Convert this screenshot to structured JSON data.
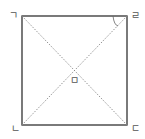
{
  "diagram": {
    "type": "square-with-diagonals",
    "vertices": {
      "top_left": {
        "label": "ㄱ",
        "x": 22,
        "y": 16
      },
      "top_right": {
        "label": "ㄹ",
        "x": 127,
        "y": 16
      },
      "bottom_right": {
        "label": "ㄷ",
        "x": 127,
        "y": 125
      },
      "bottom_left": {
        "label": "ㄴ",
        "x": 22,
        "y": 125
      }
    },
    "center": {
      "label": "ㅁ",
      "x": 74.5,
      "y": 70.5
    },
    "diagonals": [
      "ㄱㄷ",
      "ㄹㄴ"
    ],
    "angle_mark": {
      "vertex": "ㄹ",
      "between": [
        "ㄹㄱ",
        "ㄹㄴ"
      ]
    },
    "colors": {
      "edge": "#333333",
      "diagonal": "#888888",
      "label": "#555555"
    }
  }
}
